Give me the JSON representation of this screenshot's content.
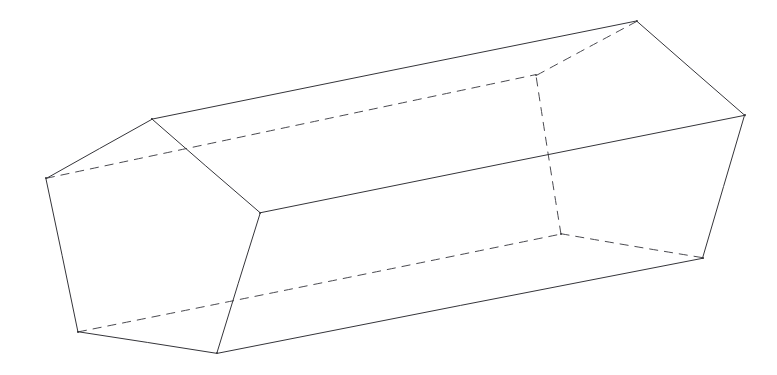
{
  "figure": {
    "background_color": "#ffffff",
    "visible_edge_color": "#35353a",
    "hidden_edge_color": "#4a4a50",
    "canvas": {
      "width": 777,
      "height": 375
    },
    "vertices": {
      "near_left": {
        "label": "A",
        "x": 46,
        "y": 178
      },
      "near_top": {
        "label": "B",
        "x": 152,
        "y": 119
      },
      "near_right": {
        "label": "C",
        "x": 260,
        "y": 213
      },
      "near_bottom": {
        "label": "D",
        "x": 217,
        "y": 353
      },
      "near_bottom_left": {
        "label": "E",
        "x": 78,
        "y": 332
      },
      "far_hidden_top": {
        "label": "A2",
        "x": 536,
        "y": 75
      },
      "far_top": {
        "label": "B2",
        "x": 637,
        "y": 21
      },
      "far_right": {
        "label": "C2",
        "x": 745,
        "y": 115
      },
      "far_bottom_right": {
        "label": "D2",
        "x": 703,
        "y": 258
      },
      "far_hidden_bottom": {
        "label": "E2",
        "x": 561,
        "y": 234
      }
    },
    "edges_visible": [
      {
        "name": "near-A-B",
        "from": "near_left",
        "to": "near_top"
      },
      {
        "name": "near-B-C",
        "from": "near_top",
        "to": "near_right"
      },
      {
        "name": "near-C-D",
        "from": "near_right",
        "to": "near_bottom"
      },
      {
        "name": "near-D-E",
        "from": "near_bottom",
        "to": "near_bottom_left"
      },
      {
        "name": "near-E-A",
        "from": "near_bottom_left",
        "to": "near_left"
      },
      {
        "name": "far-B2-C2",
        "from": "far_top",
        "to": "far_right"
      },
      {
        "name": "far-C2-D2",
        "from": "far_right",
        "to": "far_bottom_right"
      },
      {
        "name": "long-B-B2",
        "from": "near_top",
        "to": "far_top"
      },
      {
        "name": "long-C-C2",
        "from": "near_right",
        "to": "far_right"
      },
      {
        "name": "long-D-D2",
        "from": "near_bottom",
        "to": "far_bottom_right"
      }
    ],
    "edges_hidden": [
      {
        "name": "far-A2-B2",
        "from": "far_hidden_top",
        "to": "far_top"
      },
      {
        "name": "far-D2-E2",
        "from": "far_bottom_right",
        "to": "far_hidden_bottom"
      },
      {
        "name": "far-E2-A2",
        "from": "far_hidden_bottom",
        "to": "far_hidden_top"
      },
      {
        "name": "long-A-A2",
        "from": "near_left",
        "to": "far_hidden_top"
      },
      {
        "name": "long-E-E2",
        "from": "near_bottom_left",
        "to": "far_hidden_bottom"
      }
    ],
    "faces": [
      {
        "name": "near-pentagon",
        "vertices": [
          "near_left",
          "near_top",
          "near_right",
          "near_bottom",
          "near_bottom_left"
        ]
      },
      {
        "name": "far-pentagon",
        "vertices": [
          "far_hidden_top",
          "far_top",
          "far_right",
          "far_bottom_right",
          "far_hidden_bottom"
        ]
      },
      {
        "name": "top-quad",
        "vertices": [
          "near_top",
          "far_top",
          "far_right",
          "near_right"
        ]
      },
      {
        "name": "bottom-quad",
        "vertices": [
          "near_bottom_left",
          "near_bottom",
          "far_bottom_right",
          "far_hidden_bottom"
        ]
      }
    ]
  }
}
